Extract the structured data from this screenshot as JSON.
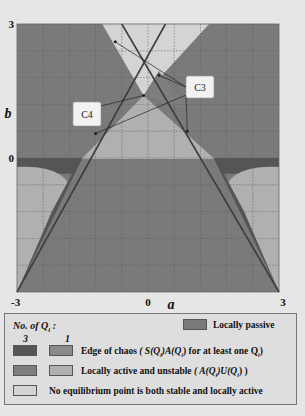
{
  "chart_data": {
    "type": "heatmap",
    "title": "",
    "xlabel": "a",
    "ylabel": "b",
    "xlim": [
      -3,
      3
    ],
    "ylim": [
      -3,
      3
    ],
    "x_ticks": [
      "-3",
      "0",
      "3"
    ],
    "y_ticks": [
      "3",
      "0"
    ],
    "grid": true,
    "grid_divisions": 10,
    "regions": [
      {
        "name": "Locally passive",
        "color": "#7a7a7a",
        "description": "region inside lower cone |b| bounded by lines b = -|a|... (main gray area)"
      },
      {
        "name": "Edge of chaos (3 Q_i)",
        "color": "#5a5a5a"
      },
      {
        "name": "Edge of chaos (1 Q_i)",
        "color": "#8a8a8a"
      },
      {
        "name": "Locally active and unstable (3 Q_i)",
        "color": "#7e7e7e"
      },
      {
        "name": "Locally active and unstable (1 Q_i)",
        "color": "#b0b0b0"
      },
      {
        "name": "No equilibrium point is both stable and locally active",
        "color": "#d0d0d0"
      }
    ],
    "boundary_lines": [
      {
        "name": "left line",
        "from": [
          -3,
          -3
        ],
        "to": [
          0.4,
          3
        ]
      },
      {
        "name": "right line",
        "from": [
          3,
          -3
        ],
        "to": [
          -0.6,
          3
        ]
      }
    ],
    "callouts": [
      {
        "label": "C4",
        "points_to": [
          [
            -0.1,
            1.4
          ]
        ]
      },
      {
        "label": "C3",
        "points_to": [
          [
            -0.75,
            2.6
          ],
          [
            0.25,
            1.85
          ],
          [
            -1.2,
            0.55
          ],
          [
            0.9,
            0.6
          ]
        ]
      }
    ]
  },
  "legend": {
    "title": "No. of Q",
    "title_sub": "i",
    "col3": "3",
    "col1": "1",
    "passive_label": "Locally passive",
    "edge_label_prefix": "Edge of chaos",
    "edge_label_formula": "( S(Q",
    "edge_label_mid": ")A(Q",
    "edge_label_end": ") for at least one Q",
    "edge_label_close": ")",
    "active_label_prefix": "Locally active and unstable",
    "active_label_formula": "( A(Q",
    "active_label_mid": ")U(Q",
    "active_label_end": ") )",
    "sub_i": "i",
    "none_label": "No equilibrium point is both stable and locally active",
    "colors": {
      "passive": "#7a7a7a",
      "edge3": "#555555",
      "edge1": "#8a8a8a",
      "active3": "#7e7e7e",
      "active1": "#b0b0b0",
      "none": "#d4d4d4"
    }
  }
}
